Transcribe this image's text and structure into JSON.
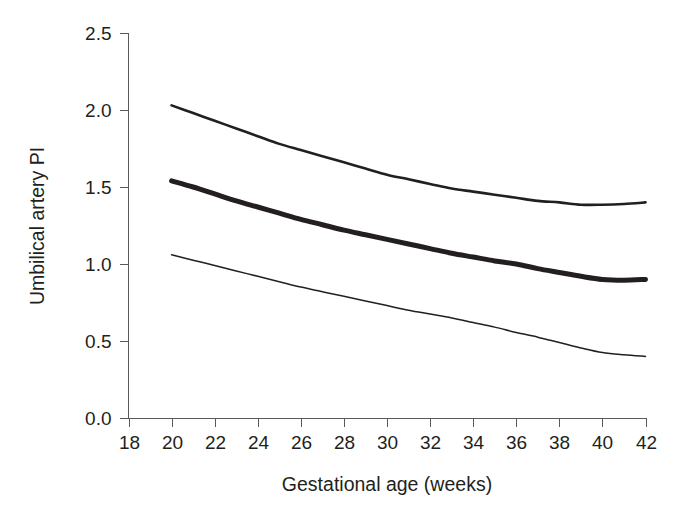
{
  "chart_data": {
    "type": "line",
    "title": "",
    "xlabel": "Gestational age (weeks)",
    "ylabel": "Umbilical artery PI",
    "xlim": [
      18,
      42
    ],
    "ylim": [
      0.0,
      2.5
    ],
    "grid": false,
    "legend": "none",
    "xticks": [
      18,
      20,
      22,
      24,
      26,
      28,
      30,
      32,
      34,
      36,
      38,
      40,
      42
    ],
    "xtick_labels": [
      "18",
      "20",
      "22",
      "24",
      "26",
      "28",
      "30",
      "32",
      "34",
      "36",
      "38",
      "40",
      "42"
    ],
    "yticks": [
      0.0,
      0.5,
      1.0,
      1.5,
      2.0,
      2.5
    ],
    "ytick_labels": [
      "0.0",
      "0.5",
      "1.0",
      "1.5",
      "2.0",
      "2.5"
    ],
    "x": [
      20,
      21,
      22,
      23,
      24,
      25,
      26,
      27,
      28,
      29,
      30,
      31,
      32,
      33,
      34,
      35,
      36,
      37,
      38,
      39,
      40,
      41,
      42
    ],
    "series": [
      {
        "name": "upper-centile",
        "line_weight": "medium",
        "color": "#231f20",
        "values": [
          2.03,
          1.98,
          1.93,
          1.88,
          1.83,
          1.78,
          1.74,
          1.7,
          1.66,
          1.62,
          1.58,
          1.55,
          1.52,
          1.49,
          1.47,
          1.45,
          1.43,
          1.41,
          1.4,
          1.385,
          1.385,
          1.39,
          1.4
        ]
      },
      {
        "name": "median-centile",
        "line_weight": "thick",
        "color": "#231f20",
        "values": [
          1.54,
          1.5,
          1.455,
          1.41,
          1.37,
          1.33,
          1.29,
          1.255,
          1.22,
          1.19,
          1.16,
          1.13,
          1.1,
          1.07,
          1.045,
          1.02,
          1.0,
          0.97,
          0.945,
          0.92,
          0.9,
          0.895,
          0.9
        ]
      },
      {
        "name": "lower-centile",
        "line_weight": "thin",
        "color": "#231f20",
        "values": [
          1.06,
          1.025,
          0.99,
          0.955,
          0.92,
          0.885,
          0.85,
          0.82,
          0.79,
          0.76,
          0.73,
          0.7,
          0.675,
          0.65,
          0.62,
          0.59,
          0.555,
          0.525,
          0.49,
          0.455,
          0.425,
          0.41,
          0.4
        ]
      }
    ]
  },
  "axes": {
    "y_axis_title": "Umbilical artery PI",
    "x_axis_title": "Gestational age (weeks)"
  }
}
